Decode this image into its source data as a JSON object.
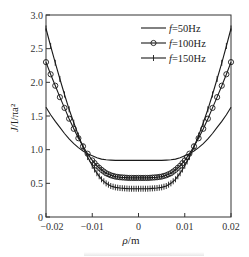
{
  "chart_data": {
    "type": "line",
    "title": "",
    "xlabel": "ρ/m",
    "ylabel": "J/I/πa²",
    "xlim": [
      -0.02,
      0.02
    ],
    "ylim": [
      0,
      3.0
    ],
    "grid": false,
    "legend_position": "upper-center-right",
    "x_ticks": [
      -0.02,
      -0.01,
      0,
      0.01,
      0.02
    ],
    "x_tick_labels": [
      "−0.02",
      "−0.01",
      "0",
      "0.01",
      "0.02"
    ],
    "y_ticks": [
      0,
      0.5,
      1.0,
      1.5,
      2.0,
      2.5,
      3.0
    ],
    "y_tick_labels": [
      "0",
      "0.5",
      "1.0",
      "1.5",
      "2.0",
      "2.5",
      "3.0"
    ],
    "x": [
      -0.02,
      -0.019,
      -0.018,
      -0.017,
      -0.016,
      -0.015,
      -0.014,
      -0.013,
      -0.012,
      -0.011,
      -0.01,
      -0.009,
      -0.008,
      -0.007,
      -0.006,
      -0.005,
      -0.004,
      -0.003,
      -0.002,
      -0.001,
      0,
      0.001,
      0.002,
      0.003,
      0.004,
      0.005,
      0.006,
      0.007,
      0.008,
      0.009,
      0.01,
      0.011,
      0.012,
      0.013,
      0.014,
      0.015,
      0.016,
      0.017,
      0.018,
      0.019,
      0.02
    ],
    "series": [
      {
        "name": "f=50Hz",
        "marker": "none",
        "values": [
          1.63,
          1.52,
          1.42,
          1.33,
          1.24,
          1.16,
          1.09,
          1.03,
          0.98,
          0.94,
          0.91,
          0.88,
          0.86,
          0.85,
          0.845,
          0.84,
          0.84,
          0.84,
          0.84,
          0.84,
          0.84,
          0.84,
          0.84,
          0.84,
          0.84,
          0.84,
          0.845,
          0.85,
          0.86,
          0.88,
          0.91,
          0.94,
          0.98,
          1.03,
          1.09,
          1.16,
          1.24,
          1.33,
          1.42,
          1.52,
          1.63
        ]
      },
      {
        "name": "f=100Hz",
        "marker": "circle",
        "values": [
          2.3,
          2.12,
          1.95,
          1.78,
          1.62,
          1.46,
          1.31,
          1.17,
          1.05,
          0.94,
          0.84,
          0.76,
          0.7,
          0.65,
          0.62,
          0.6,
          0.59,
          0.585,
          0.58,
          0.58,
          0.58,
          0.58,
          0.58,
          0.585,
          0.59,
          0.6,
          0.62,
          0.65,
          0.7,
          0.76,
          0.84,
          0.94,
          1.05,
          1.17,
          1.31,
          1.46,
          1.62,
          1.78,
          1.95,
          2.12,
          2.3
        ]
      },
      {
        "name": "f=150Hz",
        "marker": "plus",
        "values": [
          2.8,
          2.54,
          2.29,
          2.05,
          1.82,
          1.6,
          1.4,
          1.21,
          1.04,
          0.89,
          0.76,
          0.65,
          0.56,
          0.5,
          0.46,
          0.44,
          0.43,
          0.425,
          0.42,
          0.42,
          0.42,
          0.42,
          0.42,
          0.425,
          0.43,
          0.44,
          0.46,
          0.5,
          0.56,
          0.65,
          0.76,
          0.89,
          1.04,
          1.21,
          1.4,
          1.6,
          1.82,
          2.05,
          2.29,
          2.54,
          2.8
        ]
      }
    ]
  },
  "legend": {
    "items": [
      {
        "label_italic": "f",
        "label_rest": "=50Hz",
        "marker": "none"
      },
      {
        "label_italic": "f",
        "label_rest": "=100Hz",
        "marker": "circle"
      },
      {
        "label_italic": "f",
        "label_rest": "=150Hz",
        "marker": "plus"
      }
    ]
  },
  "axes": {
    "x_title_italic": "ρ",
    "x_title_rest": "/m",
    "y_title_italic": "J",
    "y_title_rest": "/I/πa²"
  },
  "style": {
    "line_color": "#1a1a1a",
    "frame_color": "#333333",
    "background": "#ffffff"
  }
}
